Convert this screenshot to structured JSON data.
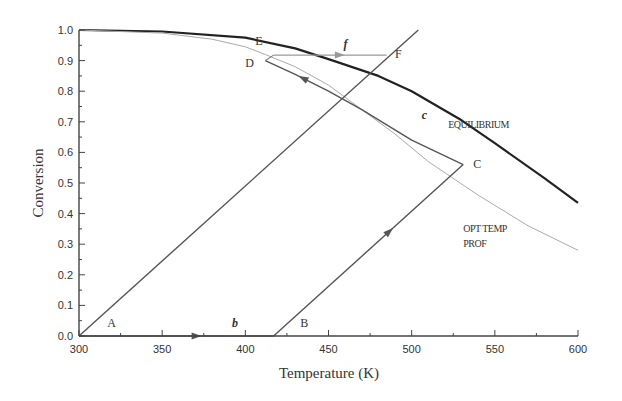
{
  "chart_data": {
    "type": "line",
    "title": "",
    "xlabel": "Temperature (K)",
    "ylabel": "Conversion",
    "xlim": [
      300,
      600
    ],
    "ylim": [
      0.0,
      1.0
    ],
    "x_ticks": [
      "300",
      "350",
      "400",
      "450",
      "500",
      "550",
      "600"
    ],
    "y_ticks": [
      "0.0",
      "0.1",
      "0.2",
      "0.3",
      "0.4",
      "0.5",
      "0.6",
      "0.7",
      "0.8",
      "0.9",
      "1.0"
    ],
    "grid": false,
    "series": [
      {
        "name": "EQUILIBRIUM",
        "style": "solid-thick",
        "x": [
          300,
          350,
          400,
          430,
          450,
          480,
          500,
          530,
          550,
          580,
          600
        ],
        "y": [
          1.0,
          0.995,
          0.975,
          0.94,
          0.905,
          0.85,
          0.8,
          0.705,
          0.63,
          0.515,
          0.435
        ]
      },
      {
        "name": "OPT TEMP PROF",
        "style": "thin-light",
        "x": [
          300,
          350,
          380,
          400,
          412,
          430,
          450,
          470,
          490,
          510,
          540,
          570,
          600
        ],
        "y": [
          1.0,
          0.99,
          0.97,
          0.945,
          0.92,
          0.88,
          0.82,
          0.74,
          0.66,
          0.57,
          0.46,
          0.36,
          0.28
        ]
      },
      {
        "name": "Adiabatic line A",
        "style": "solid",
        "x": [
          300,
          504
        ],
        "y": [
          0.0,
          1.0
        ]
      },
      {
        "name": "Path b (heating A to B)",
        "style": "solid-arrow",
        "x": [
          300,
          417
        ],
        "y": [
          0.0,
          0.0
        ]
      },
      {
        "name": "Adiabatic reaction B to C",
        "style": "solid-arrow",
        "x": [
          417,
          531
        ],
        "y": [
          0.0,
          0.56
        ]
      },
      {
        "name": "Path c (C to D along optimum)",
        "style": "solid-arrow",
        "x": [
          531,
          500,
          470,
          450,
          430,
          412
        ],
        "y": [
          0.56,
          0.64,
          0.74,
          0.8,
          0.855,
          0.9
        ]
      },
      {
        "name": "D to E",
        "style": "thin",
        "x": [
          412,
          417
        ],
        "y": [
          0.9,
          0.918
        ]
      },
      {
        "name": "Path f (E to F)",
        "style": "thin-arrow",
        "x": [
          417,
          485
        ],
        "y": [
          0.918,
          0.918
        ]
      }
    ],
    "annotations": [
      {
        "text": "A",
        "x": 317,
        "y": 0.03
      },
      {
        "text": "b",
        "x": 392,
        "y": 0.03,
        "italic": true
      },
      {
        "text": "B",
        "x": 433,
        "y": 0.03
      },
      {
        "text": "C",
        "x": 537,
        "y": 0.55
      },
      {
        "text": "c",
        "x": 506,
        "y": 0.71,
        "italic": true
      },
      {
        "text": "D",
        "x": 400,
        "y": 0.88
      },
      {
        "text": "E",
        "x": 406,
        "y": 0.95
      },
      {
        "text": "f",
        "x": 459,
        "y": 0.94,
        "italic": true
      },
      {
        "text": "F",
        "x": 490,
        "y": 0.91
      },
      {
        "text": "EQUILIBRIUM",
        "x": 522,
        "y": 0.68
      },
      {
        "text": "OPT TEMP",
        "x": 531,
        "y": 0.34
      },
      {
        "text": "PROF",
        "x": 531,
        "y": 0.29
      }
    ]
  }
}
